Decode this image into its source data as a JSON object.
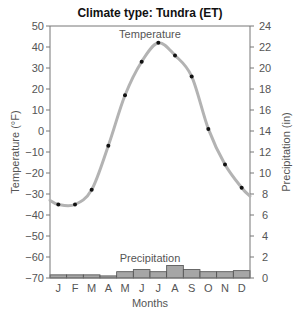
{
  "chart_data": {
    "type": "line+bar",
    "title": "Climate type: Tundra (ET)",
    "xlabel": "Months",
    "ylabel_left": "Temperature (°F)",
    "ylabel_right": "Precipitation (in)",
    "categories": [
      "J",
      "F",
      "M",
      "A",
      "M",
      "J",
      "J",
      "A",
      "S",
      "O",
      "N",
      "D"
    ],
    "ylim_left": [
      -70,
      50
    ],
    "yticks_left": [
      50,
      40,
      30,
      20,
      10,
      0,
      -10,
      -20,
      -30,
      -40,
      -50,
      -60,
      -70
    ],
    "ylim_right": [
      0,
      24
    ],
    "yticks_right": [
      24,
      22,
      20,
      18,
      16,
      14,
      12,
      10,
      8,
      6,
      4,
      2,
      0
    ],
    "grid": false,
    "series": [
      {
        "name": "Temperature",
        "type": "line",
        "axis": "left",
        "values": [
          -35,
          -35,
          -28,
          -7,
          17,
          33,
          42,
          36,
          26,
          1,
          -16,
          -27
        ]
      },
      {
        "name": "Precipitation",
        "type": "bar",
        "axis": "right",
        "values": [
          0.3,
          0.3,
          0.3,
          0.2,
          0.6,
          0.8,
          0.6,
          1.2,
          0.8,
          0.6,
          0.6,
          0.7
        ]
      }
    ],
    "annotations": [
      "Temperature",
      "Precipitation"
    ]
  },
  "colors": {
    "line": "#b3b3b3",
    "bar_fill": "#a6a6a6",
    "bar_stroke": "#4d4d4d",
    "axis": "#777777",
    "point": "#111111"
  }
}
